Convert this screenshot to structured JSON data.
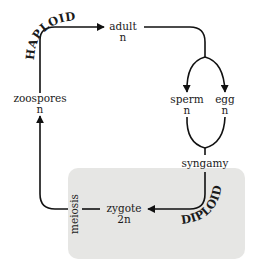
{
  "colors": {
    "background": "#ffffff",
    "diploid_box": "#e6e6e4",
    "ink": "#111111"
  },
  "phases": {
    "haploid": "HAPLOID",
    "diploid": "DIPLOID"
  },
  "nodes": {
    "adult": {
      "label": "adult",
      "ploidy": "n"
    },
    "sperm": {
      "label": "sperm",
      "ploidy": "n"
    },
    "egg": {
      "label": "egg",
      "ploidy": "n"
    },
    "syngamy": {
      "label": "syngamy"
    },
    "zygote": {
      "label": "zygote",
      "ploidy": "2n"
    },
    "meiosis": {
      "label": "meiosis"
    },
    "zoospores": {
      "label": "zoospores",
      "ploidy": "n"
    }
  },
  "edges": [
    {
      "from": "zoospores",
      "to": "adult"
    },
    {
      "from": "adult",
      "to": "sperm"
    },
    {
      "from": "adult",
      "to": "egg"
    },
    {
      "from": "sperm",
      "to": "syngamy"
    },
    {
      "from": "egg",
      "to": "syngamy"
    },
    {
      "from": "syngamy",
      "to": "zygote"
    },
    {
      "from": "zygote",
      "to": "meiosis"
    },
    {
      "from": "meiosis",
      "to": "zoospores"
    }
  ]
}
